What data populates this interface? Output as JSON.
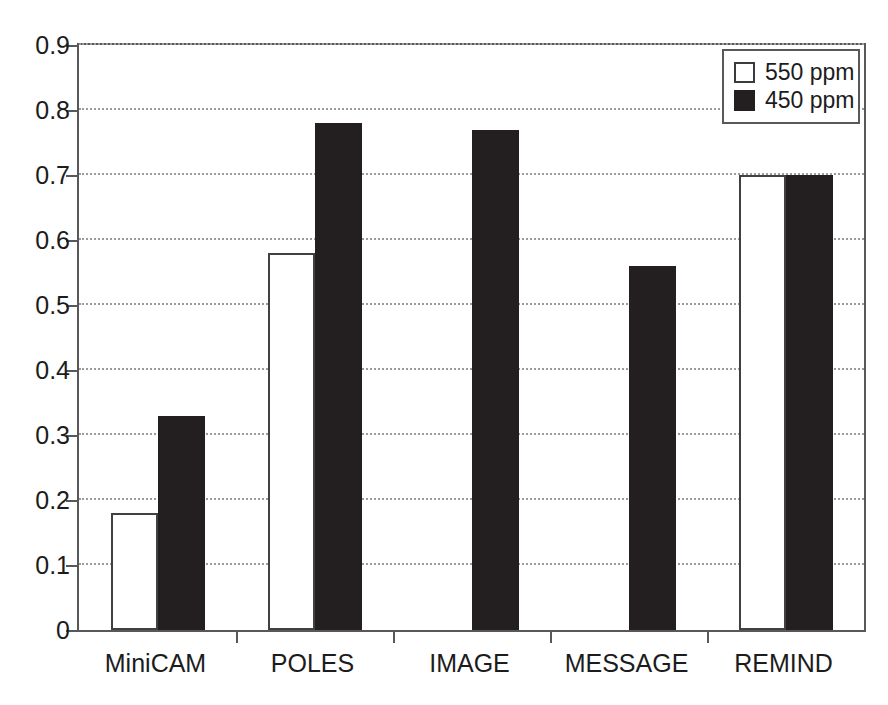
{
  "chart_data": {
    "type": "bar",
    "title": "",
    "subtitle": "",
    "xlabel": "",
    "ylabel": "",
    "categories": [
      "MiniCAM",
      "POLES",
      "IMAGE",
      "MESSAGE",
      "REMIND"
    ],
    "series": [
      {
        "name": "550 ppm",
        "color": "#ffffff",
        "edge_color": "#414143",
        "values": [
          0.18,
          0.58,
          null,
          null,
          0.7
        ]
      },
      {
        "name": "450 ppm",
        "color": "#231f20",
        "edge_color": "#231f20",
        "values": [
          0.33,
          0.78,
          0.77,
          0.56,
          0.7
        ]
      }
    ],
    "ylim": [
      0,
      0.9
    ],
    "ytick_values": [
      0,
      0.1,
      0.2,
      0.3,
      0.4,
      0.5,
      0.6,
      0.7,
      0.8,
      0.9
    ],
    "ytick_labels": [
      "0",
      "0.1",
      "0.2",
      "0.3",
      "0.4",
      "0.5",
      "0.6",
      "0.7",
      "0.8",
      "0.9"
    ],
    "grid": true,
    "grid_style": "dotted",
    "grid_axis": "y",
    "legend_position": "top-right",
    "annotations": []
  },
  "legend": {
    "entries": [
      {
        "label": "550 ppm",
        "swatch": "white-square-swatch"
      },
      {
        "label": "450 ppm",
        "swatch": "black-square-swatch"
      }
    ]
  },
  "colors": {
    "axis": "#58585a",
    "grid": "#9b9b9d",
    "text": "#1c1c1c",
    "bar_550": "#ffffff",
    "bar_450": "#231f20",
    "background": "#ffffff"
  }
}
